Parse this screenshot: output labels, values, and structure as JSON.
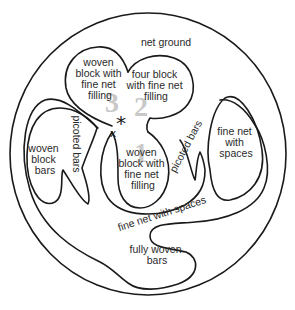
{
  "diagram": {
    "type": "lace-region-map",
    "regions": {
      "net_ground": "net ground",
      "woven_block_top_left": [
        "woven",
        "block with",
        "fine net",
        "filling"
      ],
      "four_block": [
        "four block",
        "with fine net",
        "filling"
      ],
      "woven_block_bars": [
        "woven",
        "block",
        "bars"
      ],
      "picoted_bars_left": "picoted bars",
      "woven_block_center": [
        "woven",
        "block with",
        "fine net",
        "filling"
      ],
      "picoted_bars_right": "picoted bars",
      "fine_net_with_spaces_right": [
        "fine net",
        "with",
        "spaces"
      ],
      "fine_net_with_spaces_lower": "fine net with spaces",
      "fully_woven_bars": [
        "fully woven",
        "bars"
      ]
    },
    "numbers": [
      "3",
      "2",
      "1"
    ],
    "markers": {
      "asterisk": "*",
      "cross": "x"
    },
    "colors": {
      "line": "#1a1a1a",
      "text": "#2a2a2a",
      "numbers": "#c8c8c8",
      "background": "#ffffff"
    }
  }
}
